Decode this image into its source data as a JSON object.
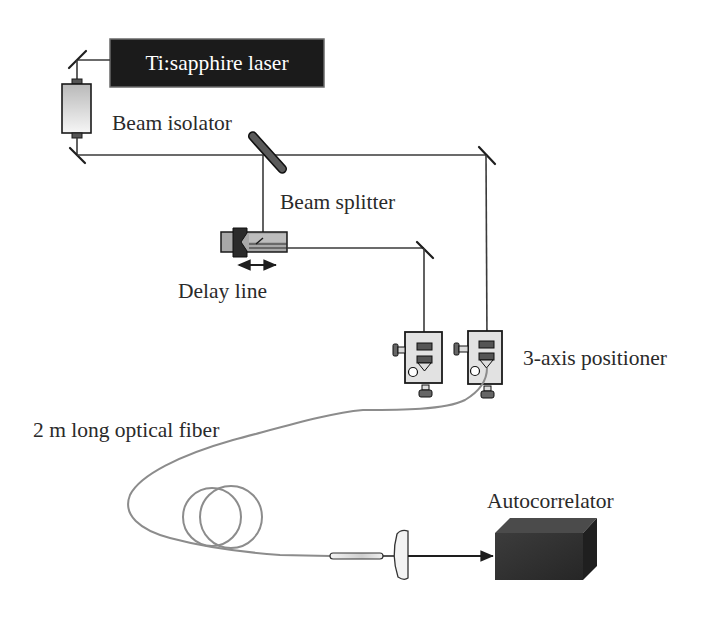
{
  "diagram": {
    "labels": {
      "laser": "Ti:sapphire laser",
      "isolator": "Beam isolator",
      "splitter": "Beam splitter",
      "delay_line": "Delay line",
      "positioner": "3-axis positioner",
      "fiber": "2 m long optical fiber",
      "autocorrelator": "Autocorrelator"
    },
    "components": [
      {
        "id": "laser",
        "label": "Ti:sapphire laser",
        "shape": "dark-rectangle"
      },
      {
        "id": "mirror-1",
        "label": "",
        "shape": "mirror-icon"
      },
      {
        "id": "isolator",
        "label": "Beam isolator",
        "shape": "cylinder-icon"
      },
      {
        "id": "mirror-2",
        "label": "",
        "shape": "mirror-icon"
      },
      {
        "id": "splitter",
        "label": "Beam splitter",
        "shape": "plate-icon"
      },
      {
        "id": "mirror-3",
        "label": "",
        "shape": "mirror-icon"
      },
      {
        "id": "delay-line",
        "label": "Delay line",
        "shape": "translation-stage-icon"
      },
      {
        "id": "mirror-4",
        "label": "",
        "shape": "mirror-icon"
      },
      {
        "id": "positioner-1",
        "label": "3-axis positioner",
        "shape": "positioner-icon"
      },
      {
        "id": "positioner-2",
        "label": "3-axis positioner",
        "shape": "positioner-icon"
      },
      {
        "id": "fiber",
        "label": "2 m long optical fiber",
        "shape": "coiled-fiber"
      },
      {
        "id": "collimator",
        "label": "",
        "shape": "fiber-connector-icon"
      },
      {
        "id": "lens",
        "label": "",
        "shape": "lens-icon"
      },
      {
        "id": "autocorrelator",
        "label": "Autocorrelator",
        "shape": "dark-cube"
      }
    ],
    "connections": [
      [
        "laser",
        "mirror-1"
      ],
      [
        "mirror-1",
        "isolator"
      ],
      [
        "isolator",
        "mirror-2"
      ],
      [
        "mirror-2",
        "splitter"
      ],
      [
        "splitter",
        "mirror-3"
      ],
      [
        "splitter",
        "delay-line"
      ],
      [
        "delay-line",
        "mirror-4"
      ],
      [
        "mirror-4",
        "positioner-1"
      ],
      [
        "mirror-3",
        "positioner-2"
      ],
      [
        "positioner-2",
        "fiber"
      ],
      [
        "fiber",
        "collimator"
      ],
      [
        "collimator",
        "lens"
      ],
      [
        "lens",
        "autocorrelator"
      ]
    ],
    "colors": {
      "laser_fill": "#1b1b1b",
      "beam": "#3a3a3a",
      "fiber": "#8c8c8c",
      "positioner_fill": "#e2e2e2",
      "autocorrelator_front": "#333333"
    }
  }
}
